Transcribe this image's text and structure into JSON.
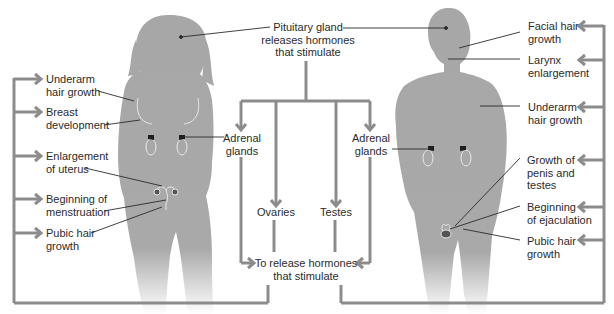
{
  "pituitary": {
    "line1": "Pituitary gland",
    "line2": "releases hormones",
    "line3": "that stimulate"
  },
  "targets": {
    "adrenal_female": {
      "line1": "Adrenal",
      "line2": "glands"
    },
    "ovaries": "Ovaries",
    "testes": "Testes",
    "adrenal_male": {
      "line1": "Adrenal",
      "line2": "glands"
    }
  },
  "release": {
    "line1": "To release hormones",
    "line2": "that stimulate"
  },
  "female_effects": [
    {
      "line1": "Underarm",
      "line2": "hair growth"
    },
    {
      "line1": "Breast",
      "line2": "development"
    },
    {
      "line1": "Enlargement",
      "line2": "of uterus"
    },
    {
      "line1": "Beginning of",
      "line2": "menstruation"
    },
    {
      "line1": "Pubic hair",
      "line2": "growth"
    }
  ],
  "male_effects": [
    {
      "line1": "Facial hair",
      "line2": "growth"
    },
    {
      "line1": "Larynx",
      "line2": "enlargement"
    },
    {
      "line1": "Underarm",
      "line2": "hair growth"
    },
    {
      "line1": "Growth of",
      "line2": "penis and",
      "line3": "testes"
    },
    {
      "line1": "Beginning",
      "line2": "of ejaculation"
    },
    {
      "line1": "Pubic hair",
      "line2": "growth"
    }
  ],
  "colors": {
    "silhouette": "#a7a7a7",
    "arrow": "#8c8c8c",
    "leader": "#2b2b2b",
    "organ_outline": "#e8e8e8",
    "gland": "#1e1e1e"
  }
}
